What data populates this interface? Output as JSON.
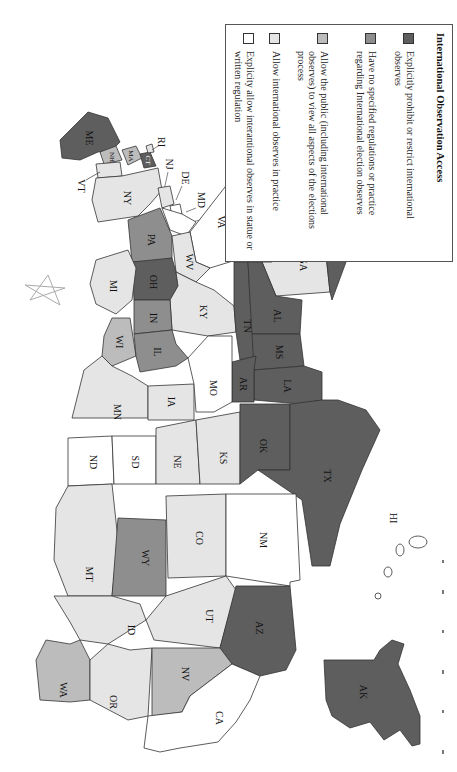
{
  "orientation": "rotated-90-clockwise",
  "legend": {
    "title": "International Observation Access",
    "items": [
      {
        "category": 1,
        "color": "#5e5e5e",
        "label": "Explicitly prohibit or restrict international observes"
      },
      {
        "category": 2,
        "color": "#8e8e8e",
        "label": "Have no specified regulations or practice regarding International election observes"
      },
      {
        "category": 3,
        "color": "#bcbcbc",
        "label": "Allow the public (including international observes) to view all aspects of the elections process"
      },
      {
        "category": 4,
        "color": "#e5e5e5",
        "label": "Allow international observes in practice"
      },
      {
        "category": 5,
        "color": "#ffffff",
        "label": "Explicity allow interantional observes in statue or written regulation"
      }
    ]
  },
  "states": {
    "ME": {
      "label": "ME",
      "category": 1
    },
    "NH": {
      "label": "NH",
      "category": 3
    },
    "VT": {
      "label": "VT",
      "category": 4
    },
    "MA": {
      "label": "MA",
      "category": 3
    },
    "RI": {
      "label": "RI",
      "category": 4
    },
    "CT": {
      "label": "CT",
      "category": 1
    },
    "NY": {
      "label": "NY",
      "category": 4
    },
    "NJ": {
      "label": "NJ",
      "category": 4
    },
    "DE": {
      "label": "DE",
      "category": 5
    },
    "MD": {
      "label": "MD",
      "category": 5
    },
    "DC": {
      "label": "DC",
      "category": 5
    },
    "PA": {
      "label": "PA",
      "category": 2
    },
    "VA": {
      "label": "VA",
      "category": 5
    },
    "WV": {
      "label": "WV",
      "category": 4
    },
    "NC": {
      "label": "NC",
      "category": 4
    },
    "SC": {
      "label": "SC",
      "category": 3
    },
    "GA": {
      "label": "GA",
      "category": 4
    },
    "FL": {
      "label": "FL",
      "category": 1
    },
    "OH": {
      "label": "OH",
      "category": 1
    },
    "MI": {
      "label": "MI",
      "category": 4
    },
    "IN": {
      "label": "IN",
      "category": 2
    },
    "KY": {
      "label": "KY",
      "category": 4
    },
    "TN": {
      "label": "TN",
      "category": 1
    },
    "AL": {
      "label": "AL",
      "category": 1
    },
    "MS": {
      "label": "MS",
      "category": 1
    },
    "WI": {
      "label": "WI",
      "category": 3
    },
    "IL": {
      "label": "IL",
      "category": 2
    },
    "MN": {
      "label": "MN",
      "category": 4
    },
    "IA": {
      "label": "IA",
      "category": 4
    },
    "MO": {
      "label": "MO",
      "category": 5
    },
    "AR": {
      "label": "AR",
      "category": 1
    },
    "LA": {
      "label": "LA",
      "category": 1
    },
    "ND": {
      "label": "ND",
      "category": 5
    },
    "SD": {
      "label": "SD",
      "category": 5
    },
    "NE": {
      "label": "NE",
      "category": 4
    },
    "KS": {
      "label": "KS",
      "category": 4
    },
    "OK": {
      "label": "OK",
      "category": 1
    },
    "TX": {
      "label": "TX",
      "category": 1
    },
    "MT": {
      "label": "MT",
      "category": 4
    },
    "WY": {
      "label": "WY",
      "category": 2
    },
    "CO": {
      "label": "CO",
      "category": 4
    },
    "NM": {
      "label": "NM",
      "category": 5
    },
    "ID": {
      "label": "ID",
      "category": 4
    },
    "UT": {
      "label": "UT",
      "category": 4
    },
    "AZ": {
      "label": "AZ",
      "category": 1
    },
    "WA": {
      "label": "WA",
      "category": 3
    },
    "OR": {
      "label": "OR",
      "category": 4
    },
    "NV": {
      "label": "NV",
      "category": 3
    },
    "CA": {
      "label": "CA",
      "category": 5
    },
    "AK": {
      "label": "AK",
      "category": 1
    },
    "HI": {
      "label": "HI",
      "category": 5
    }
  }
}
